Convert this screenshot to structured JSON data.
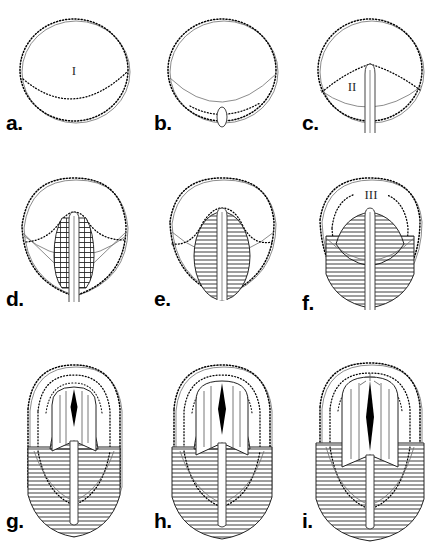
{
  "figure": {
    "panel_count": 9,
    "background_color": "#ffffff",
    "ink_color": "#000000",
    "columns": 3,
    "rows": 3
  },
  "panels": [
    {
      "id": "a",
      "label": "a.",
      "stage_numeral": "I",
      "description": "Spherical blastula with dotted surface outline and inner dotted arc at lower margin",
      "has_archenteron": false,
      "has_hatching": false,
      "has_dome": false
    },
    {
      "id": "b",
      "label": "b.",
      "stage_numeral": "",
      "description": "Sphere with dotted blastopore arc and small oval invagination at vegetal pole",
      "has_archenteron": false,
      "has_hatching": false,
      "has_dome": false
    },
    {
      "id": "c",
      "label": "c.",
      "stage_numeral": "II",
      "description": "Sphere with narrow tube extending downward through the vegetal pole",
      "has_archenteron": true,
      "has_hatching": false,
      "has_dome": false
    },
    {
      "id": "d",
      "label": "d.",
      "stage_numeral": "",
      "description": "Pear shaped embryo with central tube flanked by segmented hatched tissue",
      "has_archenteron": true,
      "has_hatching": true,
      "has_dome": false
    },
    {
      "id": "e",
      "label": "e.",
      "stage_numeral": "",
      "description": "Embryo with bilobed dotted contour and dense hatched oval body around the tube",
      "has_archenteron": true,
      "has_hatching": true,
      "has_dome": false
    },
    {
      "id": "f",
      "label": "f.",
      "stage_numeral": "III",
      "description": "Broadened embryo with extensive horizontal hatching and concentric dotted contours",
      "has_archenteron": true,
      "has_hatching": true,
      "has_dome": false
    },
    {
      "id": "g",
      "label": "g.",
      "stage_numeral": "",
      "description": "Elongated embryo, domed apical organ with vertical striations and black wedge",
      "has_archenteron": true,
      "has_hatching": true,
      "has_dome": true
    },
    {
      "id": "h",
      "label": "h.",
      "stage_numeral": "",
      "description": "Further elongated embryo with enlarged dome and longer black wedge",
      "has_archenteron": true,
      "has_hatching": true,
      "has_dome": true
    },
    {
      "id": "i",
      "label": "i.",
      "stage_numeral": "",
      "description": "Most advanced stage, widest hatched body and tallest striated dome with apical marks",
      "has_archenteron": true,
      "has_hatching": true,
      "has_dome": true
    }
  ]
}
